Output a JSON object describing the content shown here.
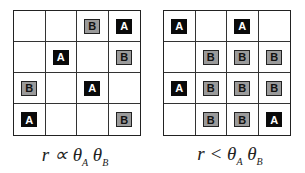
{
  "panels": [
    {
      "id": "left",
      "grid": [
        [
          "",
          "",
          "B",
          "A"
        ],
        [
          "",
          "A",
          "",
          "B"
        ],
        [
          "B",
          "",
          "A",
          ""
        ],
        [
          "A",
          "",
          "",
          "B"
        ]
      ],
      "caption": {
        "lhs": "r",
        "op": "∝",
        "t1": "θ",
        "s1": "A",
        "t2": "θ",
        "s2": "B"
      }
    },
    {
      "id": "right",
      "grid": [
        [
          "A",
          "",
          "A",
          ""
        ],
        [
          "",
          "B",
          "B",
          "B"
        ],
        [
          "A",
          "B",
          "B",
          "B"
        ],
        [
          "",
          "B",
          "B",
          "A"
        ]
      ],
      "caption": {
        "lhs": "r",
        "op": "<",
        "t1": "θ",
        "s1": "A",
        "t2": "θ",
        "s2": "B"
      }
    }
  ],
  "colors": {
    "token_a": "#0a0a0a",
    "token_b": "#9a9a9a",
    "grid_line": "#333333"
  }
}
